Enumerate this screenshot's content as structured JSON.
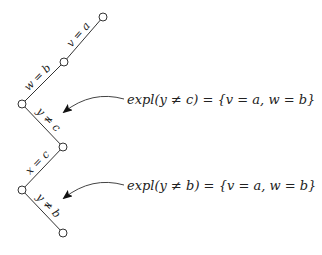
{
  "diagram": {
    "nodes": [
      {
        "id": "n1",
        "x": 103,
        "y": 17
      },
      {
        "id": "n2",
        "x": 64,
        "y": 62
      },
      {
        "id": "n3",
        "x": 22,
        "y": 104
      },
      {
        "id": "n4",
        "x": 63,
        "y": 147
      },
      {
        "id": "n5",
        "x": 22,
        "y": 190
      },
      {
        "id": "n6",
        "x": 63,
        "y": 233
      }
    ],
    "edges": [
      {
        "from": "n1",
        "to": "n2",
        "label": "v = a"
      },
      {
        "from": "n2",
        "to": "n3",
        "label": "w = b"
      },
      {
        "from": "n3",
        "to": "n4",
        "label": "y ≠ c"
      },
      {
        "from": "n4",
        "to": "n5",
        "label": "x = c"
      },
      {
        "from": "n5",
        "to": "n6",
        "label": "y ≠ b"
      }
    ],
    "annotations": [
      {
        "text": "expl(y ≠ c) = {v = a, w = b}",
        "points_to_edge": "y ≠ c"
      },
      {
        "text": "expl(y ≠ b) = {v = a, w = b}",
        "points_to_edge": "y ≠ b"
      }
    ],
    "colors": {
      "line": "#333333",
      "background": "#ffffff"
    }
  }
}
